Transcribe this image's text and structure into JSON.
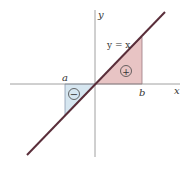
{
  "diagram": {
    "axis_labels": {
      "x": "x",
      "y": "y"
    },
    "line_label": "y = x",
    "point_labels": {
      "a": "a",
      "b": "b"
    },
    "regions": [
      {
        "name": "negative-region",
        "sign": "−",
        "color": "#d6e6f0"
      },
      {
        "name": "positive-region",
        "sign": "+",
        "color": "#e8c4c4"
      }
    ],
    "colors": {
      "line": "#5a2e3a",
      "axis": "#888888",
      "triangle_edge": "#7a7a9a"
    }
  }
}
